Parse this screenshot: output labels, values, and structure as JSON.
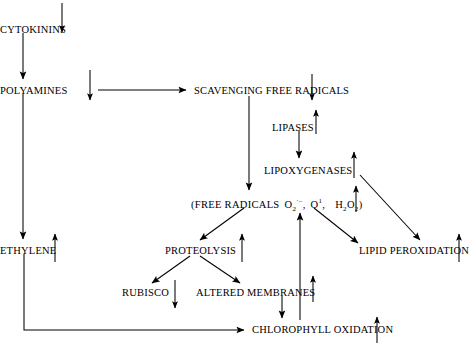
{
  "diagram": {
    "type": "flowchart",
    "background": "#ffffff",
    "stroke_color": "#000000",
    "width": 470,
    "height": 347,
    "nodes": [
      {
        "id": "cytokinins",
        "label": "CYTOKININS",
        "x": 0,
        "y": 25,
        "clipped_left": true
      },
      {
        "id": "polyamines",
        "label": "POLYAMINES",
        "x": 0,
        "y": 86,
        "clipped_left": true
      },
      {
        "id": "ethylene",
        "label": "ETHYLENE",
        "x": 0,
        "y": 246,
        "clipped_left": true
      },
      {
        "id": "scavenging",
        "label": "SCAVENGING FREE RADICALS",
        "x": 194,
        "y": 86,
        "clipped_left": false
      },
      {
        "id": "lipases",
        "label": "LIPASES",
        "x": 272,
        "y": 123,
        "clipped_left": false
      },
      {
        "id": "lipoxygenases",
        "label": "LIPOXYGENASES",
        "x": 264,
        "y": 166,
        "clipped_left": false
      },
      {
        "id": "proteolysis",
        "label": "PROTEOLYSIS",
        "x": 165,
        "y": 246,
        "clipped_left": false
      },
      {
        "id": "rubisco",
        "label": "RUBISCO",
        "x": 122,
        "y": 288,
        "clipped_left": false
      },
      {
        "id": "altered",
        "label": "ALTERED MEMBRANES",
        "x": 196,
        "y": 288,
        "clipped_left": false
      },
      {
        "id": "lipidperox",
        "label": "LIPID PEROXIDATION",
        "x": 359,
        "y": 246,
        "clipped_left": false
      },
      {
        "id": "chlorophyll",
        "label": "CHLOROPHYLL OXIDATION",
        "x": 252,
        "y": 325,
        "clipped_left": false
      }
    ],
    "free_radicals": {
      "x": 191,
      "y": 198,
      "open_paren": "(",
      "label": "FREE RADICALS",
      "species": [
        {
          "base": "O",
          "sub": "2",
          "sup": "·–"
        },
        {
          "base": "O",
          "sub": "",
          "sup": "1"
        },
        {
          "base": "H",
          "sub": "2",
          "sup": "",
          "base2": "O",
          "sub2": "2"
        }
      ],
      "close_paren": ")",
      "separator": ","
    },
    "indicator_arrows": [
      {
        "near": "cytokinins",
        "direction": "down"
      },
      {
        "near": "polyamines",
        "direction": "down"
      },
      {
        "near": "scavenging",
        "direction": "down"
      },
      {
        "near": "lipases",
        "direction": "up"
      },
      {
        "near": "lipoxygenases",
        "direction": "up"
      },
      {
        "near": "free-radicals",
        "direction": "up"
      },
      {
        "near": "ethylene",
        "direction": "up"
      },
      {
        "near": "proteolysis",
        "direction": "up"
      },
      {
        "near": "rubisco",
        "direction": "down"
      },
      {
        "near": "altered",
        "direction": "up"
      },
      {
        "near": "lipidperox",
        "direction": "up"
      },
      {
        "near": "chlorophyll",
        "direction": "up"
      }
    ],
    "connections": [
      {
        "from": "cytokinins",
        "to": "polyamines",
        "style": "straight-down"
      },
      {
        "from": "polyamines",
        "to": "ethylene",
        "style": "straight-down"
      },
      {
        "from": "polyamines",
        "to": "scavenging",
        "style": "straight-right"
      },
      {
        "from": "scavenging",
        "to": "free-radicals",
        "style": "straight-down"
      },
      {
        "from": "lipases",
        "to": "lipoxygenases",
        "style": "straight-down"
      },
      {
        "from": "lipoxygenases",
        "to": "lipidperox",
        "style": "diagonal-down-right"
      },
      {
        "from": "free-radicals",
        "to": "lipidperox",
        "style": "diagonal-down-right"
      },
      {
        "from": "free-radicals",
        "to": "proteolysis",
        "style": "diagonal-down-left"
      },
      {
        "from": "proteolysis",
        "to": "rubisco",
        "style": "diagonal-down-left"
      },
      {
        "from": "proteolysis",
        "to": "altered",
        "style": "diagonal-down-right"
      },
      {
        "from": "altered",
        "to": "chlorophyll",
        "style": "straight-down"
      },
      {
        "from": "chlorophyll",
        "to": "free-radicals",
        "style": "straight-up-long"
      },
      {
        "from": "ethylene",
        "to": "chlorophyll",
        "style": "elbow-down-right"
      }
    ]
  }
}
